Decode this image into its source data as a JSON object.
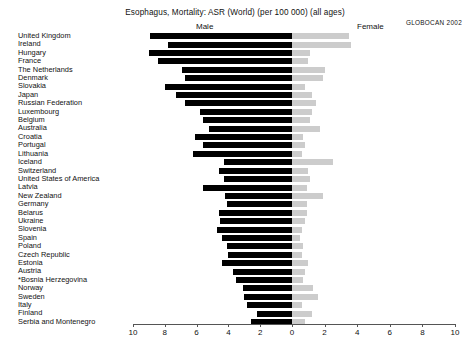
{
  "chart_data": {
    "type": "bar",
    "subtype": "population-pyramid-horizontal-paired",
    "title": "Esophagus, Mortality: ASR (World) (per 100 000) (all ages)",
    "xlabel": "",
    "ylabel": "",
    "xlim": [
      10,
      10
    ],
    "axis_center": 0,
    "grid": false,
    "legend_position": "top",
    "series": [
      {
        "name": "Male",
        "direction": "left",
        "color": "#000000"
      },
      {
        "name": "Female",
        "direction": "right",
        "color": "#cccccc"
      }
    ],
    "tick_labels_left": [
      "10",
      "8",
      "6",
      "4",
      "2",
      "0"
    ],
    "tick_labels_right": [
      "0",
      "2",
      "4",
      "6",
      "8",
      "10"
    ],
    "tick_values": [
      10,
      8,
      6,
      4,
      2,
      0,
      2,
      4,
      6,
      8,
      10
    ],
    "categories": [
      "United Kingdom",
      "Ireland",
      "Hungary",
      "France",
      "The Netherlands",
      "Denmark",
      "Slovakia",
      "Japan",
      "Russian Federation",
      "Luxembourg",
      "Belgium",
      "Australia",
      "Croatia",
      "Portugal",
      "Lithuania",
      "Iceland",
      "Switzerland",
      "United States of America",
      "Latvia",
      "New Zealand",
      "Germany",
      "Belarus",
      "Ukraine",
      "Slovenia",
      "Spain",
      "Poland",
      "Czech Republic",
      "Estonia",
      "Austria",
      "*Bosnia Herzegovina",
      "Norway",
      "Sweden",
      "Italy",
      "Finland",
      "Serbia and Montenegro"
    ],
    "male": [
      8.9,
      7.8,
      9.0,
      8.4,
      6.9,
      6.7,
      8.0,
      7.3,
      6.7,
      5.8,
      5.6,
      5.2,
      6.1,
      5.6,
      6.2,
      4.3,
      4.6,
      4.3,
      5.6,
      4.2,
      4.1,
      4.6,
      4.5,
      4.7,
      4.4,
      4.1,
      4.0,
      4.4,
      3.7,
      3.5,
      3.1,
      3.0,
      2.8,
      2.2,
      2.6
    ],
    "female": [
      3.5,
      3.6,
      1.1,
      1.0,
      2.0,
      1.9,
      0.8,
      1.2,
      1.5,
      1.2,
      1.1,
      1.7,
      0.7,
      0.8,
      0.6,
      2.5,
      1.0,
      1.1,
      0.9,
      1.9,
      0.9,
      0.9,
      0.8,
      0.6,
      0.5,
      0.7,
      0.6,
      1.0,
      0.8,
      0.7,
      1.3,
      1.6,
      0.6,
      1.2,
      0.8
    ]
  },
  "labels": {
    "male_header": "Male",
    "female_header": "Female"
  },
  "footer": {
    "source": "GLOBOCAN  2002"
  }
}
